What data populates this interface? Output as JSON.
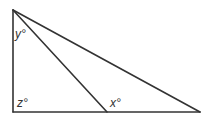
{
  "diagram": {
    "type": "geometry-triangle",
    "stroke_color": "#333333",
    "background": "#ffffff",
    "vertices": {
      "top": [
        13,
        10
      ],
      "bottom_left": [
        13,
        112
      ],
      "bottom_right": [
        200,
        112
      ],
      "cevian_foot": [
        107,
        112
      ]
    },
    "labels": {
      "y": "y°",
      "z": "z°",
      "x": "x°"
    }
  }
}
